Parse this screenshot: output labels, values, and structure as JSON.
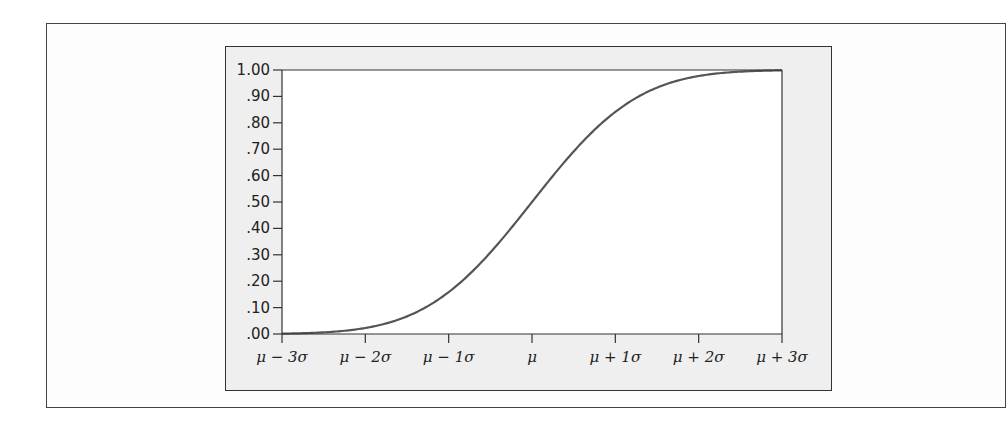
{
  "chart_data": {
    "type": "line",
    "title": "",
    "xlabel": "",
    "ylabel": "",
    "x_tick_labels": [
      "μ − 3σ",
      "μ − 2σ",
      "μ − 1σ",
      "μ",
      "μ + 1σ",
      "μ + 2σ",
      "μ + 3σ"
    ],
    "y_tick_labels": [
      ".00",
      ".10",
      ".20",
      ".30",
      ".40",
      ".50",
      ".60",
      ".70",
      ".80",
      ".90",
      "1.00"
    ],
    "ylim": [
      0,
      1
    ],
    "xlim_sigma": [
      -3,
      3
    ],
    "grid": false,
    "legend": null,
    "series": [
      {
        "name": "Normal CDF",
        "x_sigma": [
          -3,
          -2.5,
          -2,
          -1.5,
          -1,
          -0.5,
          0,
          0.5,
          1,
          1.5,
          2,
          2.5,
          3
        ],
        "values": [
          0.0013,
          0.0062,
          0.0228,
          0.0668,
          0.1587,
          0.3085,
          0.5,
          0.6915,
          0.8413,
          0.9332,
          0.9772,
          0.9938,
          0.9987
        ],
        "color": "#555555"
      }
    ]
  },
  "colors": {
    "panel_bg": "#efefef",
    "plot_bg": "#ffffff",
    "axis": "#333333",
    "curve": "#555555"
  }
}
